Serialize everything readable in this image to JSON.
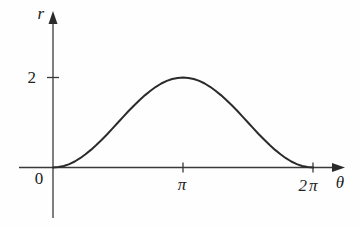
{
  "figure": {
    "background": "#fefefe",
    "axis_color": "#3a3a3a",
    "curve_color": "#2b2b2b"
  },
  "chart_data": {
    "type": "line",
    "title": "",
    "xlabel": "θ",
    "ylabel": "r",
    "origin_label": "0",
    "x_unit": "multiples of π radians",
    "grid": false,
    "legend": false,
    "xlim_in_pi_units": [
      -0.26,
      2.24
    ],
    "ylim": [
      -1.1,
      3.4
    ],
    "x_ticks": [
      {
        "value": 1,
        "label": "π"
      },
      {
        "value": 2,
        "label": "2π"
      }
    ],
    "y_ticks": [
      {
        "value": 2,
        "label": "2"
      }
    ],
    "series": [
      {
        "name": "curve",
        "x_in_pi_units": [
          0,
          0.0417,
          0.0833,
          0.125,
          0.1667,
          0.2083,
          0.25,
          0.2917,
          0.3333,
          0.375,
          0.4167,
          0.4583,
          0.5,
          0.5417,
          0.5833,
          0.625,
          0.6667,
          0.7083,
          0.75,
          0.7917,
          0.8333,
          0.875,
          0.9167,
          0.9583,
          1,
          1.0417,
          1.0833,
          1.125,
          1.1667,
          1.2083,
          1.25,
          1.2917,
          1.3333,
          1.375,
          1.4167,
          1.4583,
          1.5,
          1.5417,
          1.5833,
          1.625,
          1.6667,
          1.7083,
          1.75,
          1.7917,
          1.8333,
          1.875,
          1.9167,
          1.9583,
          2
        ],
        "r_values": [
          0,
          0.009,
          0.034,
          0.076,
          0.134,
          0.207,
          0.293,
          0.391,
          0.5,
          0.617,
          0.741,
          0.869,
          1.0,
          1.131,
          1.259,
          1.383,
          1.5,
          1.609,
          1.707,
          1.793,
          1.866,
          1.924,
          1.966,
          1.991,
          2.0,
          1.991,
          1.966,
          1.924,
          1.866,
          1.793,
          1.707,
          1.609,
          1.5,
          1.383,
          1.259,
          1.131,
          1.0,
          0.869,
          0.741,
          0.617,
          0.5,
          0.391,
          0.293,
          0.207,
          0.134,
          0.076,
          0.034,
          0.009,
          0
        ]
      }
    ]
  }
}
